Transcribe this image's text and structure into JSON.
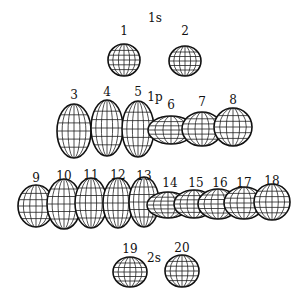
{
  "diagram": {
    "groups": [
      {
        "label": "1s",
        "x": 155,
        "y": 22
      },
      {
        "label": "1p",
        "x": 155,
        "y": 101
      },
      {
        "label": "1d",
        "x": 145,
        "y": 190
      },
      {
        "label": "2s",
        "x": 154,
        "y": 262
      }
    ],
    "orbitals": [
      {
        "n": "1",
        "cx": 124,
        "cy": 60,
        "rx": 16,
        "ry": 16,
        "lx": 124,
        "ly": 35
      },
      {
        "n": "2",
        "cx": 185,
        "cy": 61,
        "rx": 16,
        "ry": 15,
        "lx": 185,
        "ly": 35
      },
      {
        "n": "3",
        "cx": 74,
        "cy": 131,
        "rx": 17,
        "ry": 27,
        "lx": 74,
        "ly": 99
      },
      {
        "n": "4",
        "cx": 107,
        "cy": 128,
        "rx": 16,
        "ry": 28,
        "lx": 107,
        "ly": 96
      },
      {
        "n": "5",
        "cx": 138,
        "cy": 129,
        "rx": 16,
        "ry": 28,
        "lx": 138,
        "ly": 96
      },
      {
        "n": "6",
        "cx": 171,
        "cy": 130,
        "rx": 23,
        "ry": 14,
        "lx": 171,
        "ly": 109
      },
      {
        "n": "7",
        "cx": 202,
        "cy": 129,
        "rx": 20,
        "ry": 17,
        "lx": 202,
        "ly": 106
      },
      {
        "n": "8",
        "cx": 233,
        "cy": 127,
        "rx": 19,
        "ry": 19,
        "lx": 233,
        "ly": 104
      },
      {
        "n": "9",
        "cx": 36,
        "cy": 206,
        "rx": 18,
        "ry": 21,
        "lx": 36,
        "ly": 182
      },
      {
        "n": "10",
        "cx": 64,
        "cy": 204,
        "rx": 17,
        "ry": 25,
        "lx": 64,
        "ly": 180
      },
      {
        "n": "11",
        "cx": 91,
        "cy": 203,
        "rx": 16,
        "ry": 25,
        "lx": 91,
        "ly": 179
      },
      {
        "n": "12",
        "cx": 118,
        "cy": 203,
        "rx": 15,
        "ry": 25,
        "lx": 118,
        "ly": 179
      },
      {
        "n": "13",
        "cx": 144,
        "cy": 202,
        "rx": 15,
        "ry": 25,
        "lx": 144,
        "ly": 180
      },
      {
        "n": "14",
        "cx": 168,
        "cy": 205,
        "rx": 21,
        "ry": 13,
        "lx": 170,
        "ly": 187
      },
      {
        "n": "15",
        "cx": 194,
        "cy": 204,
        "rx": 20,
        "ry": 14,
        "lx": 196,
        "ly": 187
      },
      {
        "n": "16",
        "cx": 218,
        "cy": 204,
        "rx": 20,
        "ry": 15,
        "lx": 220,
        "ly": 187
      },
      {
        "n": "17",
        "cx": 244,
        "cy": 203,
        "rx": 20,
        "ry": 16,
        "lx": 244,
        "ly": 187
      },
      {
        "n": "18",
        "cx": 272,
        "cy": 202,
        "rx": 18,
        "ry": 18,
        "lx": 272,
        "ly": 185
      },
      {
        "n": "19",
        "cx": 130,
        "cy": 272,
        "rx": 17,
        "ry": 15,
        "lx": 130,
        "ly": 253
      },
      {
        "n": "20",
        "cx": 182,
        "cy": 271,
        "rx": 17,
        "ry": 16,
        "lx": 182,
        "ly": 252
      }
    ]
  }
}
